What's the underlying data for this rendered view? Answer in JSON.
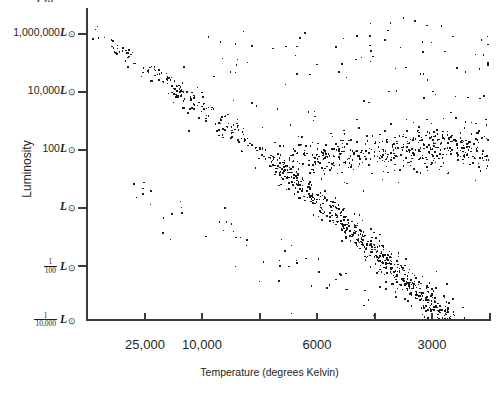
{
  "figure": {
    "type": "scatter",
    "point_color": "#1a1a1a",
    "axis_color": "#3b3b3b",
    "background": "#ffffff"
  },
  "axes": {
    "y_title": "Luminosity",
    "x_title": "Temperature (degrees Kelvin)",
    "y_tick_labels": [
      {
        "prefix": "1,000,000",
        "unit": "L",
        "sun": "⊙",
        "frac": null
      },
      {
        "prefix": "10,000",
        "unit": "L",
        "sun": "⊙",
        "frac": null
      },
      {
        "prefix": "100",
        "unit": "L",
        "sun": "⊙",
        "frac": null
      },
      {
        "prefix": "",
        "unit": "L",
        "sun": "⊙",
        "frac": null
      },
      {
        "prefix": "",
        "unit": "L",
        "sun": "⊙",
        "frac": {
          "num": "1",
          "den": "100"
        }
      },
      {
        "prefix": "",
        "unit": "L",
        "sun": "⊙",
        "frac": {
          "num": "1",
          "den": "10,000"
        }
      }
    ],
    "x_tick_labels": [
      "25,000",
      "10,000",
      "6000",
      "3000"
    ],
    "top_cut_symbol": "L⊙"
  },
  "chart_data": {
    "type": "scatter",
    "title": "",
    "xlabel": "Temperature (degrees Kelvin)",
    "ylabel": "Luminosity",
    "x_scale": "log-reversed",
    "y_scale": "log",
    "x_ticks": [
      25000,
      10000,
      6000,
      3000
    ],
    "y_ticks": [
      1000000,
      10000,
      100,
      1,
      0.01,
      0.0001
    ],
    "y_tick_text": [
      "1,000,000 L⊙",
      "10,000 L⊙",
      "100 L⊙",
      "L⊙",
      "1/100 L⊙",
      "1/10,000 L⊙"
    ],
    "grid": false,
    "legend": null,
    "series": [
      {
        "name": "main-sequence",
        "n_points": 640,
        "description": "Dense diagonal band from hot luminous upper-left to cool faint lower-right"
      },
      {
        "name": "giant-branch",
        "n_points": 300,
        "description": "Horizontal clump of cool luminous stars around 100 L⊙ on the right side"
      },
      {
        "name": "supergiants-scatter",
        "n_points": 60,
        "description": "Sparse high-luminosity points above the giant branch"
      },
      {
        "name": "white-dwarfs",
        "n_points": 40,
        "description": "Sparse faint sequence in the lower-left below the main sequence"
      }
    ]
  }
}
